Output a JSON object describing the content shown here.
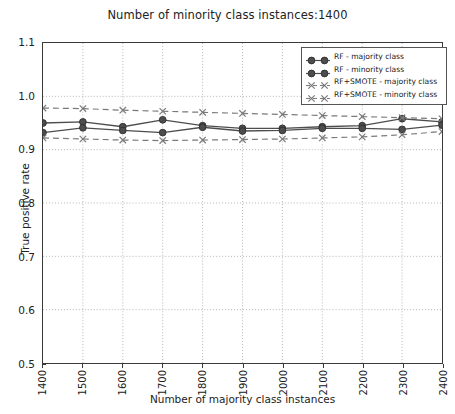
{
  "chart_data": {
    "type": "line",
    "title": "Number of minority class instances:1400",
    "xlabel": "Number of majority class instances",
    "ylabel": "True positive rate",
    "x": [
      1400,
      1500,
      1600,
      1700,
      1800,
      1900,
      2000,
      2100,
      2200,
      2300,
      2400
    ],
    "xlim": [
      1400,
      2400
    ],
    "ylim": [
      0.5,
      1.1
    ],
    "xticks": [
      "1400",
      "1500",
      "1600",
      "1700",
      "1800",
      "1900",
      "2000",
      "2100",
      "2200",
      "2300",
      "2400"
    ],
    "yticks": [
      "0.5",
      "0.6",
      "0.7",
      "0.8",
      "0.9",
      "1.0",
      "1.1"
    ],
    "grid": true,
    "legend_position": "upper right",
    "series": [
      {
        "name": "RF - majority class",
        "marker": "circle",
        "linestyle": "solid",
        "color": "#4d4d4d",
        "values": [
          0.95,
          0.952,
          0.943,
          0.956,
          0.945,
          0.94,
          0.94,
          0.943,
          0.945,
          0.958,
          0.952
        ]
      },
      {
        "name": "RF - minority class",
        "marker": "circle",
        "linestyle": "solid",
        "color": "#4d4d4d",
        "values": [
          0.932,
          0.941,
          0.936,
          0.932,
          0.942,
          0.935,
          0.936,
          0.94,
          0.94,
          0.938,
          0.946
        ]
      },
      {
        "name": "RF+SMOTE - majority class",
        "marker": "x",
        "linestyle": "dashed",
        "color": "#7a7a7a",
        "values": [
          0.978,
          0.977,
          0.974,
          0.972,
          0.97,
          0.968,
          0.966,
          0.964,
          0.962,
          0.96,
          0.958
        ]
      },
      {
        "name": "RF+SMOTE - minority class",
        "marker": "x",
        "linestyle": "dashed",
        "color": "#7a7a7a",
        "values": [
          0.922,
          0.92,
          0.918,
          0.917,
          0.918,
          0.919,
          0.92,
          0.922,
          0.924,
          0.928,
          0.934
        ]
      }
    ]
  }
}
